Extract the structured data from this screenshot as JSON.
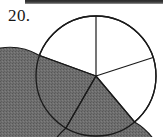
{
  "page": {
    "background_color": "#ffffff",
    "top_scan_bar_color": "#2f2f2f"
  },
  "problem": {
    "number_label": "20."
  },
  "figure": {
    "name": "pie-chart",
    "outline_color": "#1a1a1a",
    "shaded_fill_color": "#6e6e6e",
    "unshaded_fill_color": "#ffffff",
    "center_x": 96,
    "center_y": 76,
    "radius": 60
  },
  "chart_data": {
    "type": "pie",
    "title": "",
    "categories": [
      "sector-1-white-top-right",
      "sector-2-white-right",
      "sector-3-shaded-bottom",
      "sector-4-shaded-left",
      "sector-5-white-top-left"
    ],
    "values": [
      20,
      19,
      19,
      21,
      21
    ],
    "start_angle_deg": 90,
    "direction": "clockwise",
    "boundary_angles_deg": [
      90,
      18,
      -50,
      -120,
      160
    ],
    "shaded": [
      false,
      false,
      true,
      true,
      false
    ],
    "labels_shown": false,
    "legend": "none",
    "grid": false
  }
}
